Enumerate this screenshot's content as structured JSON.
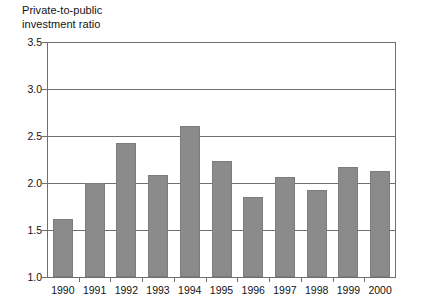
{
  "chart_data": {
    "type": "bar",
    "title": "Private-to-public\ninvestment ratio",
    "xlabel": "",
    "ylabel": "",
    "categories": [
      "1990",
      "1991",
      "1992",
      "1993",
      "1994",
      "1995",
      "1996",
      "1997",
      "1998",
      "1999",
      "2000"
    ],
    "values": [
      1.62,
      2.0,
      2.43,
      2.09,
      2.61,
      2.23,
      1.85,
      2.06,
      1.93,
      2.17,
      2.13
    ],
    "ylim": [
      1.0,
      3.5
    ],
    "yticks": [
      "1.0",
      "1.5",
      "2.0",
      "2.5",
      "3.0",
      "3.5"
    ],
    "ytick_values": [
      1.0,
      1.5,
      2.0,
      2.5,
      3.0,
      3.5
    ],
    "grid": true,
    "legend": null,
    "bar_color": "#8b8b8b",
    "axis_color": "#6f6f6f",
    "background": "#ffffff"
  }
}
